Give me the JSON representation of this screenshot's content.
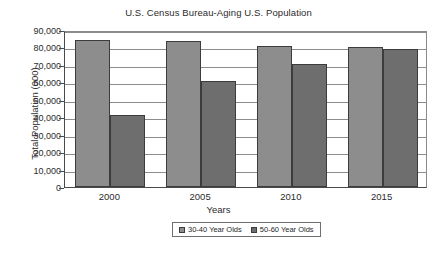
{
  "chart_data": {
    "type": "bar",
    "title": "U.S. Census Bureau-Aging U.S. Population",
    "xlabel": "Years",
    "ylabel": "Total Population (000)",
    "categories": [
      "2000",
      "2005",
      "2010",
      "2015"
    ],
    "series": [
      {
        "name": "30-40 Year Olds",
        "color": "#8d8d8d",
        "values": [
          84500,
          83500,
          81000,
          80200
        ]
      },
      {
        "name": "50-60 Year Olds",
        "color": "#6e6e6e",
        "values": [
          41000,
          61000,
          70500,
          79000
        ]
      }
    ],
    "ylim": [
      0,
      90000
    ],
    "ytick_step": 10000,
    "yticks": [
      "90,000",
      "80,000",
      "70,000",
      "60,000",
      "50,000",
      "40,000",
      "30,000",
      "20,000",
      "10,000",
      "0"
    ],
    "ytick_values": [
      90000,
      80000,
      70000,
      60000,
      50000,
      40000,
      30000,
      20000,
      10000,
      0
    ],
    "grid": true,
    "legend_position": "bottom"
  }
}
